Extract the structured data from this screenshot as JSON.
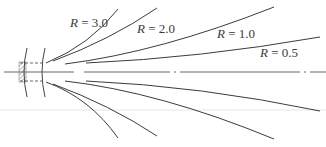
{
  "diagram": {
    "title": "",
    "labels": [
      {
        "id": "r30",
        "var": "R",
        "eq": " = ",
        "val": "3.0"
      },
      {
        "id": "r20",
        "var": "R",
        "eq": " = ",
        "val": "2.0"
      },
      {
        "id": "r10",
        "var": "R",
        "eq": " = ",
        "val": "1.0"
      },
      {
        "id": "r05",
        "var": "R",
        "eq": " = ",
        "val": "0.5"
      }
    ],
    "colors": {
      "line": "#3c3c3c",
      "axis": "#555555",
      "hatch": "#777777",
      "separator": "#e2e2e2"
    }
  }
}
